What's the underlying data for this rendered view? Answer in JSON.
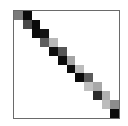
{
  "chart_data": {
    "type": "heatmap",
    "title": "",
    "xlabel": "",
    "ylabel": "",
    "rows": 12,
    "cols": 12,
    "grid": false,
    "colormap": "grayscale (darker = higher)",
    "cells": [
      {
        "row": 0,
        "col": 0,
        "value": 0.55,
        "color": "#7a7a7a"
      },
      {
        "row": 0,
        "col": 1,
        "value": 1.0,
        "color": "#0a0a0a"
      },
      {
        "row": 1,
        "col": 1,
        "value": 0.7,
        "color": "#4a4a4a"
      },
      {
        "row": 1,
        "col": 2,
        "value": 1.0,
        "color": "#0a0a0a"
      },
      {
        "row": 2,
        "col": 2,
        "value": 1.0,
        "color": "#0c0c0c"
      },
      {
        "row": 2,
        "col": 3,
        "value": 0.95,
        "color": "#141414"
      },
      {
        "row": 3,
        "col": 3,
        "value": 0.6,
        "color": "#5e5e5e"
      },
      {
        "row": 3,
        "col": 4,
        "value": 0.25,
        "color": "#b8b8b8"
      },
      {
        "row": 4,
        "col": 4,
        "value": 1.0,
        "color": "#0e0e0e"
      },
      {
        "row": 4,
        "col": 5,
        "value": 0.65,
        "color": "#565656"
      },
      {
        "row": 5,
        "col": 5,
        "value": 1.0,
        "color": "#0c0c0c"
      },
      {
        "row": 5,
        "col": 6,
        "value": 0.35,
        "color": "#a4a4a4"
      },
      {
        "row": 6,
        "col": 6,
        "value": 1.0,
        "color": "#0c0c0c"
      },
      {
        "row": 6,
        "col": 7,
        "value": 0.25,
        "color": "#bcbcbc"
      },
      {
        "row": 7,
        "col": 7,
        "value": 1.0,
        "color": "#0a0a0a"
      },
      {
        "row": 7,
        "col": 8,
        "value": 0.6,
        "color": "#5c5c5c"
      },
      {
        "row": 8,
        "col": 8,
        "value": 0.25,
        "color": "#c0c0c0"
      },
      {
        "row": 8,
        "col": 9,
        "value": 0.35,
        "color": "#a8a8a8"
      },
      {
        "row": 9,
        "col": 9,
        "value": 0.85,
        "color": "#2a2a2a"
      },
      {
        "row": 9,
        "col": 10,
        "value": 0.3,
        "color": "#b0b0b0"
      },
      {
        "row": 10,
        "col": 10,
        "value": 0.25,
        "color": "#bcbcbc"
      },
      {
        "row": 10,
        "col": 11,
        "value": 0.45,
        "color": "#8c8c8c"
      },
      {
        "row": 11,
        "col": 11,
        "value": 1.0,
        "color": "#0a0a0a"
      }
    ]
  }
}
